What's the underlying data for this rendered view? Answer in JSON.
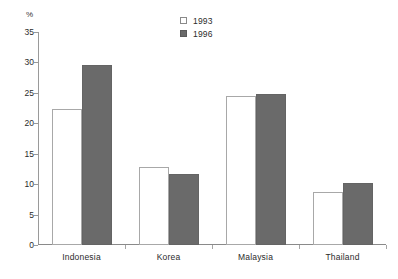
{
  "chart_data": {
    "type": "bar",
    "title": "",
    "subtitle": "",
    "xlabel": "",
    "ylabel": "%",
    "unit_label": "%",
    "ylim": [
      0,
      35
    ],
    "ytick_step": 5,
    "yticks": [
      "35",
      "30",
      "25",
      "20",
      "15",
      "10",
      "5",
      "0"
    ],
    "ytick_values": [
      35,
      30,
      25,
      20,
      15,
      10,
      5,
      0
    ],
    "grid": false,
    "legend_position": "top-center",
    "categories": [
      "Indonesia",
      "Korea",
      "Malaysia",
      "Thailand"
    ],
    "series": [
      {
        "name": "1993",
        "color": "#ffffff",
        "edge_color": "#a8a8a8",
        "values": [
          22.4,
          12.8,
          24.5,
          8.7
        ]
      },
      {
        "name": "1996",
        "color": "#6a6a6a",
        "edge_color": "#646464",
        "values": [
          29.6,
          11.6,
          24.8,
          10.2
        ]
      }
    ]
  },
  "legend": {
    "items": [
      {
        "label": "1993",
        "swatch": "hollow-square-icon"
      },
      {
        "label": "1996",
        "swatch": "filled-square-icon"
      }
    ]
  },
  "colors": {
    "bar_1993_fill": "#ffffff",
    "bar_1993_edge": "#a8a8a8",
    "bar_1996_fill": "#6a6a6a",
    "bar_1996_edge": "#646464",
    "axis": "#8a8a8a",
    "text": "#2b2b2b",
    "background": "#ffffff"
  }
}
